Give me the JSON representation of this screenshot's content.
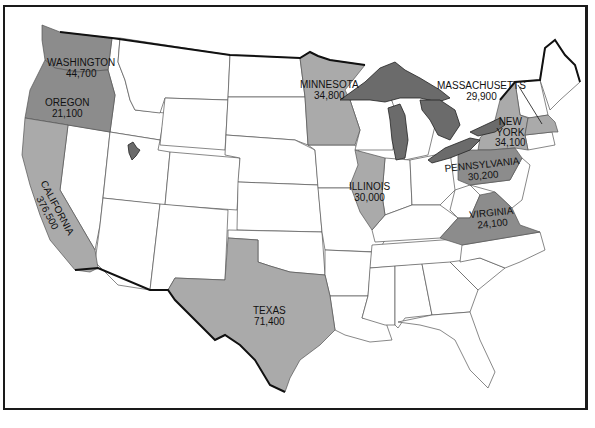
{
  "colors": {
    "highlight": "#aaaaaa",
    "highlight_dark": "#8c8c8c",
    "lakes": "#6b6b6b",
    "background": "#ffffff"
  },
  "states": [
    {
      "name": "WASHINGTON",
      "value": "44,700",
      "shade": "dark"
    },
    {
      "name": "OREGON",
      "value": "21,100",
      "shade": "dark"
    },
    {
      "name": "CALIFORNIA",
      "value": "376,500",
      "shade": "light"
    },
    {
      "name": "MINNESOTA",
      "value": "34,800",
      "shade": "light"
    },
    {
      "name": "ILLINOIS",
      "value": "30,000",
      "shade": "light"
    },
    {
      "name": "TEXAS",
      "value": "71,400",
      "shade": "light"
    },
    {
      "name": "MASSACHUSETTS",
      "value": "29,900",
      "shade": "light"
    },
    {
      "name": "NEW YORK",
      "name_lines": [
        "NEW",
        "YORK"
      ],
      "value": "34,100",
      "shade": "light"
    },
    {
      "name": "PENNSYLVANIA",
      "value": "30,200",
      "shade": "dark"
    },
    {
      "name": "VIRGINIA",
      "value": "24,100",
      "shade": "dark"
    }
  ],
  "features": {
    "great_lakes": "Great Lakes",
    "great_salt_lake": "Great Salt Lake"
  }
}
